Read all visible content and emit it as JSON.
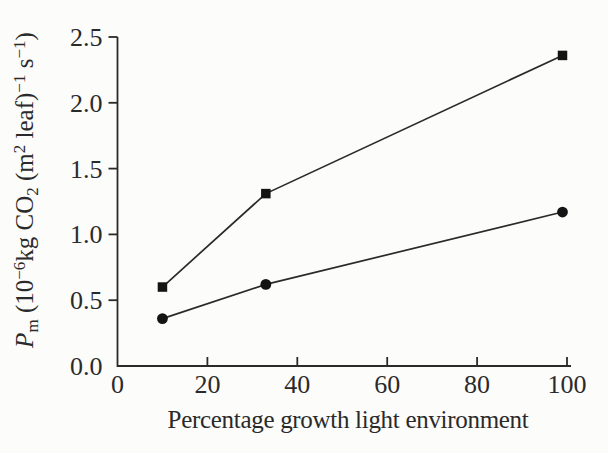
{
  "colors": {
    "background": "#fcfcfa",
    "ink": "#2a2a2a",
    "marker_fill": "#141414"
  },
  "chart_data": {
    "type": "line",
    "title": "",
    "xlabel": "Percentage growth light environment",
    "ylabel": "Pm (10−6 kg CO2 (m2 leaf)−1 s−1)",
    "ylabel_segments": [
      {
        "t": "P",
        "style": "italic"
      },
      {
        "t": "m",
        "script": "sub"
      },
      {
        "t": " (10"
      },
      {
        "t": "−6",
        "script": "sup"
      },
      {
        "t": "kg CO"
      },
      {
        "t": "2",
        "script": "sub"
      },
      {
        "t": " (m"
      },
      {
        "t": "2",
        "script": "sup"
      },
      {
        "t": " leaf)"
      },
      {
        "t": "−1",
        "script": "sup"
      },
      {
        "t": " s"
      },
      {
        "t": "−1",
        "script": "sup"
      },
      {
        "t": ")"
      }
    ],
    "xlim": [
      0,
      100
    ],
    "ylim": [
      0.0,
      2.5
    ],
    "x_ticks": [
      0,
      20,
      40,
      60,
      80,
      100
    ],
    "x_tick_labels": [
      "0",
      "20",
      "40",
      "60",
      "80",
      "100"
    ],
    "y_ticks": [
      0.0,
      0.5,
      1.0,
      1.5,
      2.0,
      2.5
    ],
    "y_tick_labels": [
      "0.0",
      "0.5",
      "1.0",
      "1.5",
      "2.0",
      "2.5"
    ],
    "grid": false,
    "legend": "none",
    "x": [
      10,
      33,
      99
    ],
    "series": [
      {
        "name": "square-series",
        "marker": "square",
        "values": [
          0.6,
          1.31,
          2.36
        ]
      },
      {
        "name": "circle-series",
        "marker": "circle",
        "values": [
          0.36,
          0.62,
          1.17
        ]
      }
    ]
  }
}
